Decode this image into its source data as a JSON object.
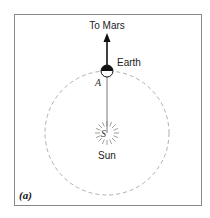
{
  "figure": {
    "panel_label": "(a)",
    "arrow_label": "To Mars",
    "earth_label": "Earth",
    "sun_label": "Sun",
    "point_a_label": "A",
    "point_s_label": "S"
  },
  "colors": {
    "frame": "#888888",
    "orbit": "#b0b0b0",
    "ink": "#111111"
  }
}
